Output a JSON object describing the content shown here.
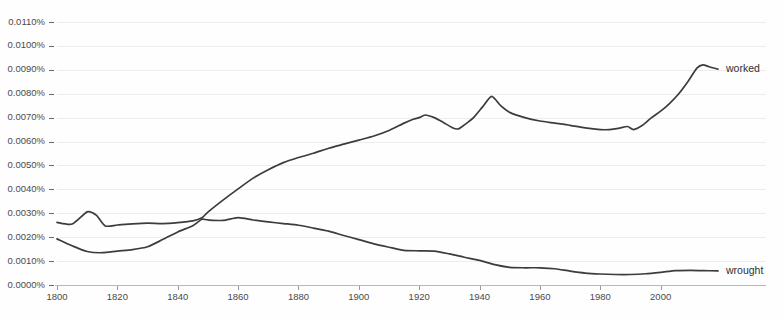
{
  "chart_data": {
    "type": "line",
    "title": "",
    "subtitle": "",
    "xlabel": "",
    "ylabel": "",
    "xlim": [
      1800,
      2019
    ],
    "ylim": [
      0.0,
      0.011
    ],
    "grid": true,
    "legend_position": "right-inline-labels",
    "y_tick_labels": [
      "0.0110%",
      "0.0100%",
      "0.0090%",
      "0.0080%",
      "0.0070%",
      "0.0060%",
      "0.0050%",
      "0.0040%",
      "0.0030%",
      "0.0020%",
      "0.0010%",
      "0.0000%"
    ],
    "y_tick_values": [
      0.011,
      0.01,
      0.009,
      0.008,
      0.007,
      0.006,
      0.005,
      0.004,
      0.003,
      0.002,
      0.001,
      0.0
    ],
    "x_tick_labels": [
      "1800",
      "1820",
      "1840",
      "1860",
      "1880",
      "1900",
      "1920",
      "1940",
      "1960",
      "1980",
      "2000"
    ],
    "x_tick_values": [
      1800,
      1820,
      1840,
      1860,
      1880,
      1900,
      1920,
      1940,
      1960,
      1980,
      2000
    ],
    "series": [
      {
        "name": "worked",
        "label": "worked",
        "color": "#3c3c3c",
        "x": [
          1800,
          1805,
          1810,
          1813,
          1816,
          1820,
          1825,
          1830,
          1835,
          1840,
          1845,
          1848,
          1850,
          1855,
          1860,
          1865,
          1870,
          1875,
          1880,
          1885,
          1890,
          1895,
          1900,
          1905,
          1910,
          1915,
          1918,
          1920,
          1922,
          1925,
          1928,
          1931,
          1933,
          1935,
          1938,
          1941,
          1944,
          1947,
          1950,
          1955,
          1960,
          1965,
          1970,
          1975,
          1980,
          1983,
          1986,
          1989,
          1991,
          1994,
          1997,
          2000,
          2003,
          2006,
          2009,
          2012,
          2014,
          2016,
          2019
        ],
        "values": [
          0.00262,
          0.00255,
          0.00306,
          0.00292,
          0.00247,
          0.00251,
          0.00256,
          0.00259,
          0.00257,
          0.00261,
          0.00268,
          0.00281,
          0.00305,
          0.00355,
          0.00402,
          0.00447,
          0.00482,
          0.00512,
          0.00533,
          0.00551,
          0.00572,
          0.00589,
          0.00606,
          0.00623,
          0.00646,
          0.00677,
          0.00693,
          0.007,
          0.00711,
          0.007,
          0.0068,
          0.00658,
          0.00653,
          0.0067,
          0.007,
          0.00745,
          0.00789,
          0.0075,
          0.00722,
          0.007,
          0.00686,
          0.00677,
          0.00668,
          0.00657,
          0.0065,
          0.0065,
          0.00655,
          0.00663,
          0.0065,
          0.00668,
          0.007,
          0.00727,
          0.0076,
          0.008,
          0.0085,
          0.00907,
          0.00921,
          0.00913,
          0.00903
        ]
      },
      {
        "name": "wrought",
        "label": "wrought",
        "color": "#3c3c3c",
        "x": [
          1800,
          1805,
          1810,
          1815,
          1820,
          1825,
          1830,
          1835,
          1840,
          1845,
          1848,
          1850,
          1855,
          1860,
          1865,
          1870,
          1875,
          1880,
          1885,
          1890,
          1895,
          1900,
          1905,
          1910,
          1915,
          1920,
          1925,
          1930,
          1935,
          1940,
          1945,
          1950,
          1955,
          1960,
          1965,
          1970,
          1975,
          1980,
          1985,
          1990,
          1995,
          2000,
          2005,
          2010,
          2014,
          2019
        ],
        "values": [
          0.00193,
          0.00164,
          0.0014,
          0.00135,
          0.00142,
          0.00148,
          0.0016,
          0.0019,
          0.00222,
          0.00248,
          0.00275,
          0.00272,
          0.0027,
          0.00282,
          0.00272,
          0.00264,
          0.00257,
          0.0025,
          0.00238,
          0.00225,
          0.00207,
          0.0019,
          0.00172,
          0.00158,
          0.00145,
          0.00143,
          0.00142,
          0.0013,
          0.00116,
          0.00103,
          0.00085,
          0.00074,
          0.00072,
          0.00072,
          0.00068,
          0.00058,
          0.0005,
          0.00046,
          0.00044,
          0.00044,
          0.00047,
          0.00053,
          0.0006,
          0.00061,
          0.0006,
          0.00059
        ]
      }
    ]
  },
  "layout": {
    "plot_left": 57,
    "plot_right": 718,
    "plot_top": 22,
    "plot_bottom": 285,
    "label_gap": 8
  },
  "colors": {
    "background": "#fefefe",
    "grid": "#ededed",
    "axis": "#b8b8b8",
    "text": "#4a4a4a",
    "line": "#3c3c3c"
  }
}
